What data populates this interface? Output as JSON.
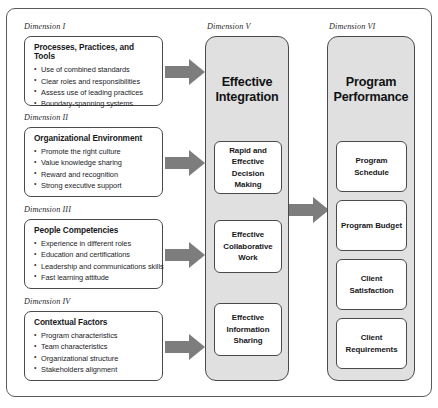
{
  "diagram": {
    "colors": {
      "column_fill": "#e0e0e0",
      "box_fill": "#ffffff",
      "border": "#4a4a4a",
      "arrow": "#7d7d7d",
      "text": "#17181a"
    },
    "left_dimensions": [
      {
        "caption": "Dimension I",
        "title": "Processes, Practices, and Tools",
        "items": [
          "Use of combined standards",
          "Clear roles and responsibilities",
          "Assess use of leading practices",
          "Boundary-spanning systems"
        ]
      },
      {
        "caption": "Dimension II",
        "title": "Organizational Environment",
        "items": [
          "Promote the right culture",
          "Value knowledge sharing",
          "Reward and recognition",
          "Strong executive support"
        ]
      },
      {
        "caption": "Dimension III",
        "title": "People Competencies",
        "items": [
          "Experience in different roles",
          "Education and certifications",
          "Leadership and communications skills",
          "Fast learning attitude"
        ]
      },
      {
        "caption": "Dimension IV",
        "title": "Contextual Factors",
        "items": [
          "Program characteristics",
          "Team characteristics",
          "Organizational structure",
          "Stakeholders alignment"
        ]
      }
    ],
    "dimension_v": {
      "caption": "Dimension V",
      "title": "Effective Integration",
      "title_line1": "Effective",
      "title_line2": "Integration",
      "boxes": [
        "Rapid and Effective Decision Making",
        "Effective Collaborative Work",
        "Effective Information Sharing"
      ]
    },
    "dimension_vi": {
      "caption": "Dimension VI",
      "title": "Program Performance",
      "title_line1": "Program",
      "title_line2": "Performance",
      "boxes": [
        "Program Schedule",
        "Program Budget",
        "Client Satisfaction",
        "Client Requirements"
      ]
    },
    "arrows": {
      "count": 5,
      "label": "flow-arrow-right"
    }
  }
}
